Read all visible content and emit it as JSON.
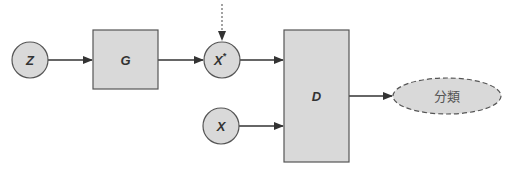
{
  "diagram": {
    "type": "gan-architecture",
    "colors": {
      "node_fill": "#d9d9d9",
      "stroke": "#555555",
      "arrow": "#333333",
      "text": "#333333",
      "output_text": "#555555"
    },
    "nodes": {
      "z": {
        "label": "Z",
        "shape": "circle"
      },
      "generator": {
        "label": "G",
        "shape": "rectangle"
      },
      "x_star": {
        "label": "X",
        "superscript": "*",
        "shape": "circle"
      },
      "x_real": {
        "label": "X",
        "shape": "circle"
      },
      "discriminator": {
        "label": "D",
        "shape": "rectangle"
      },
      "output": {
        "label": "分類",
        "shape": "dashed-ellipse"
      }
    },
    "edges": [
      {
        "from": "z",
        "to": "generator",
        "style": "solid"
      },
      {
        "from": "generator",
        "to": "x_star",
        "style": "solid"
      },
      {
        "from": "external",
        "to": "x_star",
        "style": "dotted"
      },
      {
        "from": "x_star",
        "to": "discriminator",
        "style": "solid"
      },
      {
        "from": "x_real",
        "to": "discriminator",
        "style": "solid"
      },
      {
        "from": "discriminator",
        "to": "output",
        "style": "solid"
      }
    ]
  }
}
